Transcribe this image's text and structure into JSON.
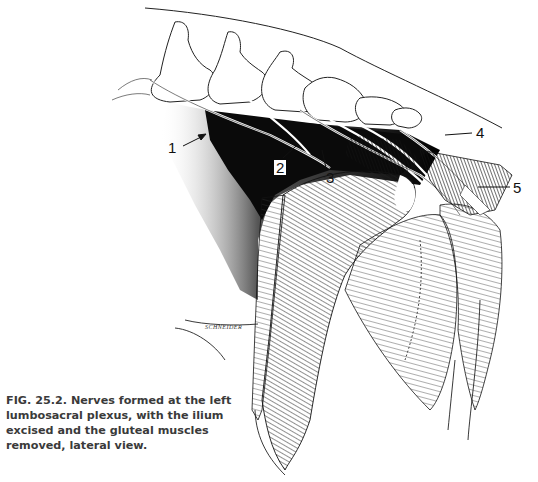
{
  "figure": {
    "number": "FIG. 25.2.",
    "caption": "Nerves formed at the left lumbosacral plexus, with the ilium excised and the gluteal muscles removed, lateral view.",
    "caption_lines": [
      "FIG. 25.2.  Nerves formed at the left",
      "lumbosacral plexus, with the ilium",
      "excised and the gluteal muscles",
      "removed, lateral view."
    ],
    "illustration": "lumbosacral-plexus-lateral-view",
    "artist_signature": "SCHNEIDER",
    "labels": [
      {
        "id": "1",
        "text": "1"
      },
      {
        "id": "2",
        "text": "2"
      },
      {
        "id": "3",
        "text": "3"
      },
      {
        "id": "4",
        "text": "4"
      },
      {
        "id": "5",
        "text": "5"
      }
    ]
  },
  "colors": {
    "ink": "#111111",
    "background": "#ffffff",
    "caption": "#3a3a3a"
  }
}
